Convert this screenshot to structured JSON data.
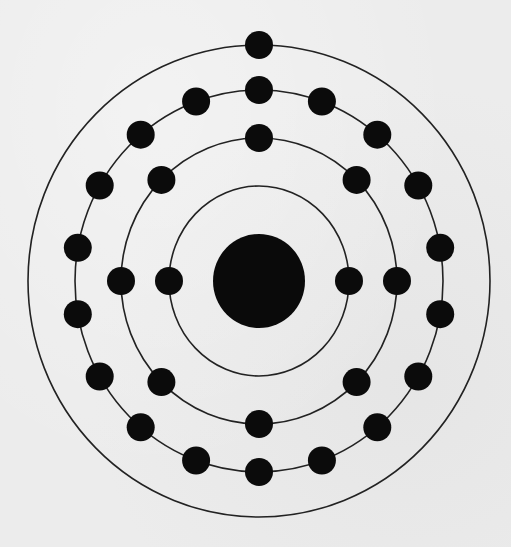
{
  "diagram": {
    "type": "bohr-atom-model",
    "element_inferred": "copper",
    "total_electrons": 29,
    "colors": {
      "background": "#ececec",
      "shell_stroke": "#222222",
      "electron_fill": "#0b0b0b",
      "nucleus_fill": "#0a0a0a"
    },
    "center": {
      "x": 259,
      "y": 281
    },
    "nucleus": {
      "rx": 46,
      "ry": 47
    },
    "electron_radius": 14,
    "shells": [
      {
        "name": "K",
        "rx": 90,
        "ry": 95,
        "electrons": 2,
        "start_angle_deg": 90,
        "step_deg": 180
      },
      {
        "name": "L",
        "rx": 138,
        "ry": 143,
        "electrons": 8,
        "start_angle_deg": 0,
        "step_deg": 45
      },
      {
        "name": "M",
        "rx": 184,
        "ry": 191,
        "electrons": 18,
        "start_angle_deg": 0,
        "step_deg": 20
      },
      {
        "name": "N",
        "rx": 231,
        "ry": 236,
        "electrons": 1,
        "start_angle_deg": 0,
        "step_deg": 360
      }
    ],
    "labels": []
  }
}
